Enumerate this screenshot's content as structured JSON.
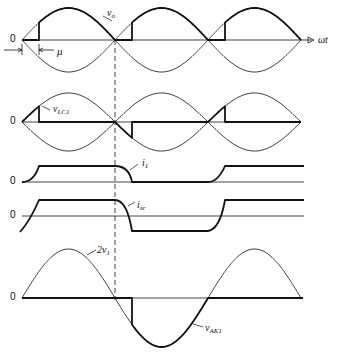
{
  "figure": {
    "axis_label": "ωt",
    "zero_label": "0",
    "panels": [
      {
        "id": "vo",
        "label_main": "v",
        "label_sub": "o",
        "zero": "0"
      },
      {
        "id": "vlc1",
        "label_main": "v",
        "label_sub": "LC1",
        "zero": "0"
      },
      {
        "id": "i1",
        "label_main": "i",
        "label_sub": "1",
        "zero": "0"
      },
      {
        "id": "isc",
        "label_main": "i",
        "label_sub": "sc",
        "zero": "0"
      },
      {
        "id": "vak1",
        "label_main": "v",
        "label_sub": "AK1",
        "zero": "0",
        "ref_main": "2v",
        "ref_sub": "1"
      }
    ],
    "overlap_angle_label": "μ"
  }
}
